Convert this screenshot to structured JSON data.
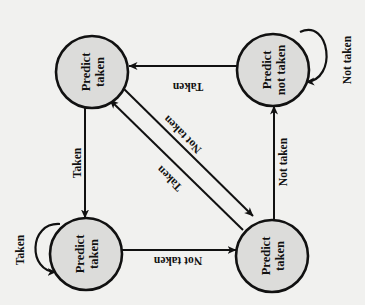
{
  "diagram": {
    "title": "",
    "orientation": "rotated 90 degrees counter-clockwise",
    "states": [
      {
        "id": "s_tl",
        "line1": "Predict",
        "line2": "taken"
      },
      {
        "id": "s_tr",
        "line1": "Predict",
        "line2": "not taken"
      },
      {
        "id": "s_bl",
        "line1": "Predict",
        "line2": "taken"
      },
      {
        "id": "s_br",
        "line1": "Predict",
        "line2": "taken"
      }
    ],
    "transitions": [
      {
        "from": "s_tr",
        "to": "s_tl",
        "label": "Taken"
      },
      {
        "from": "s_tl",
        "to": "s_bl",
        "label": "Taken"
      },
      {
        "from": "s_bl",
        "to": "s_br",
        "label": "Not taken"
      },
      {
        "from": "s_br",
        "to": "s_tr",
        "label": "Not taken"
      },
      {
        "from": "s_tl",
        "to": "s_br",
        "label": "Not taken"
      },
      {
        "from": "s_br",
        "to": "s_tl",
        "label": "Taken"
      },
      {
        "from": "s_tr",
        "to": "s_tr",
        "label": "Not taken"
      },
      {
        "from": "s_bl",
        "to": "s_bl",
        "label": "Taken"
      }
    ],
    "colors": {
      "state_fill": "#dcdcda",
      "stroke": "#111111",
      "background": "#f1f1ef"
    }
  }
}
